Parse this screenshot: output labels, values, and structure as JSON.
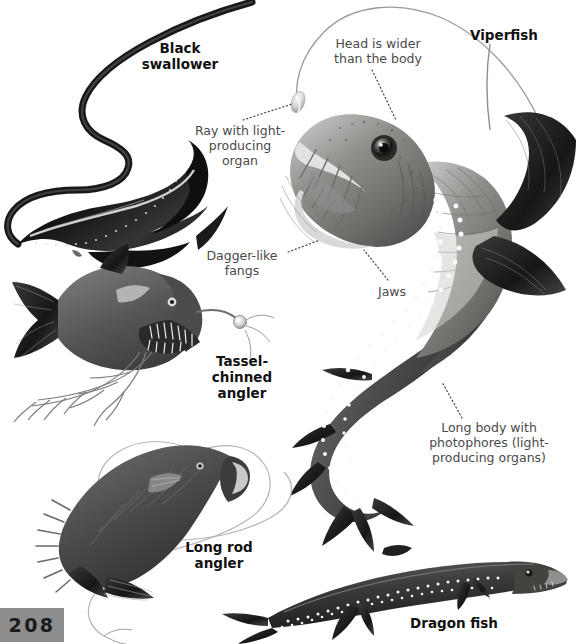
{
  "page": {
    "number": "208",
    "background_color": "#ffffff",
    "plate_color": "#8d8d8d",
    "text_color": "#3a3a3a",
    "species_text_color": "#111111"
  },
  "labels": {
    "black_swallower": "Black\nswallower",
    "viperfish": "Viperfish",
    "head_is_wider": "Head is wider\nthan the body",
    "ray_with_light": "Ray with light-\nproducing\norgan",
    "dagger_like_fangs": "Dagger-like\nfangs",
    "jaws": "Jaws",
    "tassel_chinned_angler": "Tassel-\nchinned\nangler",
    "long_body_photophores": "Long body with\nphotophores (light-\nproducing organs)",
    "long_rod_angler": "Long rod\nangler",
    "dragon_fish": "Dragon fish"
  },
  "illustrations": [
    {
      "name": "black-swallower",
      "description": "Long dark ribbon-like deep sea fish with distended jaw, upper left"
    },
    {
      "name": "viperfish",
      "description": "Large detailed viperfish with dagger fangs, scaly body, photophore dots and long dorsal ray, right side"
    },
    {
      "name": "tassel-chinned-angler",
      "description": "Angler fish with branching chin barbels and illuminated lure, left middle"
    },
    {
      "name": "long-rod-angler",
      "description": "Dark angler fish with very long thin curving fishing rod filament, lower left"
    },
    {
      "name": "dragon-fish",
      "description": "Elongated dark dragon fish with rows of white photophores, bottom right"
    }
  ]
}
